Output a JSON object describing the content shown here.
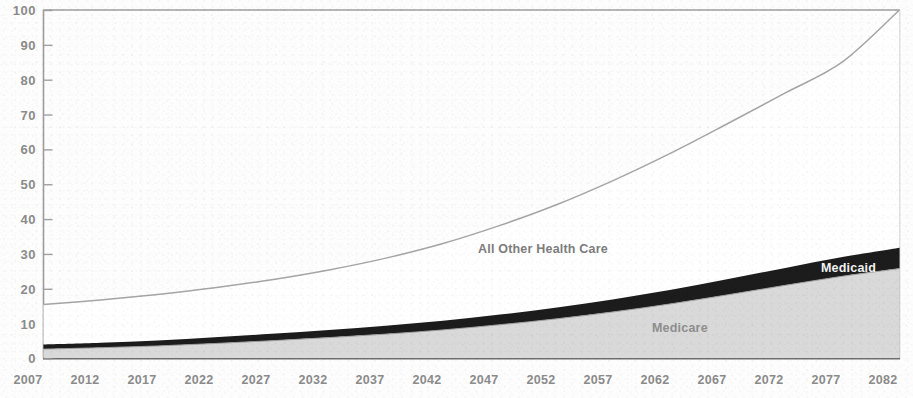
{
  "chart_data": {
    "type": "area",
    "title": "",
    "subtitle": "",
    "xlabel": "",
    "ylabel": "",
    "xlim": [
      2007,
      2082
    ],
    "ylim": [
      0,
      100
    ],
    "grid": false,
    "legend_position": "inline-annotations",
    "stacked": true,
    "x": [
      2007,
      2012,
      2017,
      2022,
      2027,
      2032,
      2037,
      2042,
      2047,
      2052,
      2057,
      2062,
      2067,
      2072,
      2077,
      2082
    ],
    "x_tick_labels": [
      "2007",
      "2012",
      "2017",
      "2022",
      "2027",
      "2032",
      "2037",
      "2042",
      "2047",
      "2052",
      "2057",
      "2062",
      "2067",
      "2072",
      "2077",
      "2082"
    ],
    "y_tick_labels": [
      "0",
      "10",
      "20",
      "30",
      "40",
      "50",
      "60",
      "70",
      "80",
      "90",
      "100"
    ],
    "y_ticks": [
      0,
      10,
      20,
      30,
      40,
      50,
      60,
      70,
      80,
      90,
      100
    ],
    "series": [
      {
        "name": "Medicare",
        "color": "#d6d6d6",
        "values": [
          2.7,
          3.1,
          3.6,
          4.3,
          5.1,
          6.0,
          7.0,
          8.2,
          9.7,
          11.4,
          13.4,
          15.7,
          18.3,
          21.0,
          23.6,
          25.8
        ]
      },
      {
        "name": "Medicaid",
        "color": "#1a1a1a",
        "values": [
          1.3,
          1.4,
          1.6,
          1.8,
          2.0,
          2.2,
          2.4,
          2.6,
          2.9,
          3.2,
          3.6,
          4.0,
          4.5,
          5.0,
          5.5,
          6.0
        ]
      },
      {
        "name": "All Other Health Care",
        "color": "#ffffff",
        "values": [
          11.5,
          12.3,
          13.2,
          14.2,
          15.5,
          17.2,
          19.4,
          22.2,
          25.6,
          29.6,
          34.2,
          39.3,
          44.7,
          50.2,
          56.0,
          68.2
        ]
      }
    ],
    "total_line": {
      "name": "Total Health Care Spending",
      "color": "#a8a8a8",
      "values": [
        15.5,
        16.8,
        18.4,
        20.3,
        22.6,
        25.4,
        28.8,
        33.0,
        38.2,
        44.2,
        51.2,
        59.0,
        67.5,
        76.2,
        85.1,
        100.0
      ]
    },
    "annotations": [
      {
        "name": "all-other-health-care",
        "text": "All Other Health Care"
      },
      {
        "name": "medicaid",
        "text": "Medicaid"
      },
      {
        "name": "medicare",
        "text": "Medicare"
      }
    ],
    "colors": {
      "medicare": "#d6d6d6",
      "medicaid": "#1a1a1a",
      "all_other": "#ffffff",
      "total_line": "#a8a8a8",
      "axis": "#9a9a9a",
      "tick_text": "#8b8b8b",
      "background": "#fdfdfd"
    }
  },
  "axis": {
    "y_labels": [
      "100",
      "90",
      "80",
      "70",
      "60",
      "50",
      "40",
      "30",
      "20",
      "10",
      "0"
    ],
    "x_labels": [
      "2007",
      "2012",
      "2017",
      "2022",
      "2027",
      "2032",
      "2037",
      "2042",
      "2047",
      "2052",
      "2057",
      "2062",
      "2067",
      "2072",
      "2077",
      "2082"
    ]
  },
  "labels": {
    "all_other_health_care": "All Other Health Care",
    "medicaid": "Medicaid",
    "medicare": "Medicare"
  }
}
